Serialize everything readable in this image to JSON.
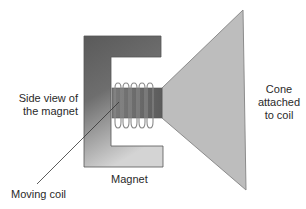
{
  "diagram": {
    "labels": {
      "side_view_line1": "Side view of",
      "side_view_line2": "the magnet",
      "cone_line1": "Cone",
      "cone_line2": "attached",
      "cone_line3": "to coil",
      "magnet": "Magnet",
      "moving_coil": "Moving coil"
    },
    "colors": {
      "magnet_dark": "#5e5e5e",
      "magnet_light": "#cfcfcf",
      "cone_fill": "#b9b9b9",
      "cone_stroke": "#8a8a8a",
      "coil_core": "#6e6e6e",
      "coil_wire": "#8a8a8a",
      "text": "#2a2a2a"
    }
  }
}
